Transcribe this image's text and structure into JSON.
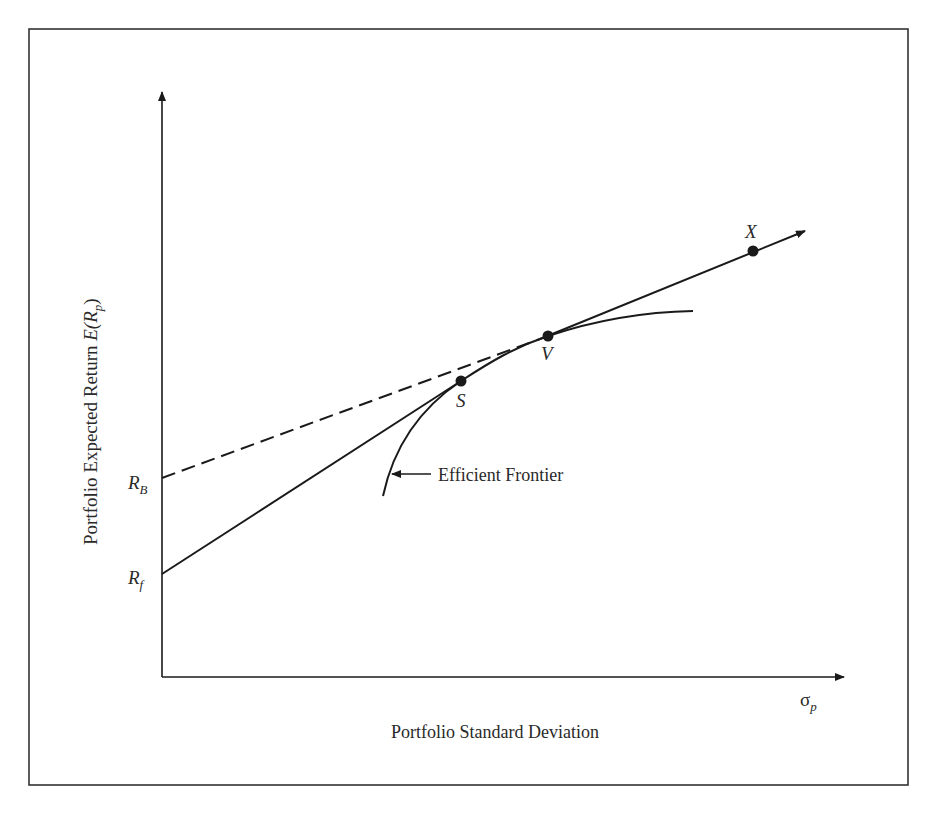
{
  "diagram": {
    "type": "capital-market-line-efficient-frontier",
    "y_axis": {
      "label_prefix": "Portfolio Expected Return ",
      "label_math_E": "E(",
      "label_math_R": "R",
      "label_math_sub": "p",
      "label_math_close": ")"
    },
    "x_axis": {
      "label": "Portfolio Standard Deviation",
      "symbol": "σ",
      "symbol_sub": "p"
    },
    "intercepts": [
      {
        "id": "RB",
        "main": "R",
        "sub": "B",
        "note": "borrowing rate (dashed line origin)"
      },
      {
        "id": "Rf",
        "main": "R",
        "sub": "f",
        "note": "risk-free rate (solid line origin)"
      }
    ],
    "points": [
      {
        "id": "S",
        "label": "S"
      },
      {
        "id": "V",
        "label": "V"
      },
      {
        "id": "X",
        "label": "X"
      }
    ],
    "curve_label": "Efficient Frontier",
    "lines": [
      {
        "name": "lending-line",
        "from": "Rf",
        "to": "S",
        "style": "solid"
      },
      {
        "name": "borrowing-line",
        "from": "RB",
        "to": "V",
        "style": "dashed",
        "continues_through": "X",
        "arrow": true
      },
      {
        "name": "efficient-frontier",
        "style": "solid-curve"
      }
    ],
    "colors": {
      "line": "#1a1a1a",
      "border": "#333333",
      "background": "#ffffff"
    }
  }
}
